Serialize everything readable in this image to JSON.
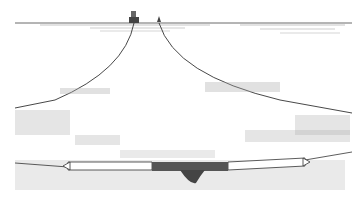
{
  "illustration": {
    "subject": "trawl net towed between boat and buoy",
    "colors": {
      "background": "#ffffff",
      "line": "#333333",
      "stipple": "#9a9a9a",
      "net_dark": "#555555"
    },
    "elements": {
      "sea_surface_y": 23,
      "boat_x": 134,
      "buoy_x": 159,
      "net_left_x": 68,
      "net_right_x": 305,
      "net_y": 64,
      "catch_x_start": 152,
      "catch_x_end": 228
    }
  }
}
